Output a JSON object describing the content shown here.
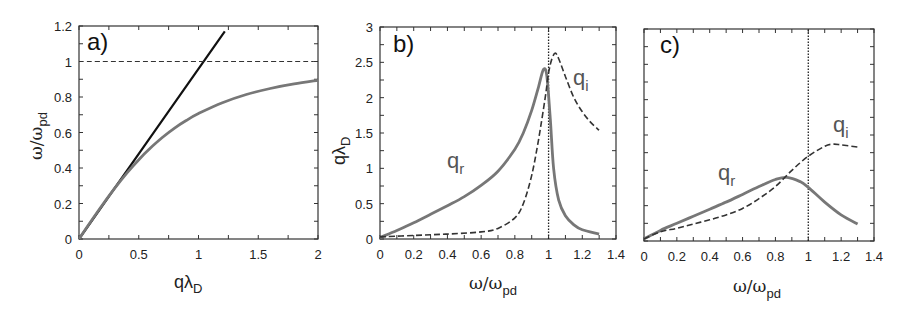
{
  "figure": {
    "panels": [
      {
        "id": "a",
        "label": "a)"
      },
      {
        "id": "b",
        "label": "b)"
      },
      {
        "id": "c",
        "label": "c)"
      }
    ]
  },
  "chart_data": [
    {
      "panel": "a)",
      "type": "line",
      "xlabel": "qλ_D",
      "ylabel": "ω/ω_pd",
      "xlim": [
        0,
        2
      ],
      "ylim": [
        0,
        1.2
      ],
      "xticks": [
        "0",
        "0.5",
        "1",
        "1.5",
        "2"
      ],
      "yticks": [
        "0",
        "0.2",
        "0.4",
        "0.6",
        "0.8",
        "1",
        "1.2"
      ],
      "grid": false,
      "series": [
        {
          "name": "linear (black solid)",
          "color": "#111111",
          "style": "solid",
          "x": [
            0,
            1.22
          ],
          "y": [
            0,
            1.17
          ]
        },
        {
          "name": "dispersion (gray solid)",
          "color": "#777777",
          "style": "solid",
          "x": [
            0,
            0.1,
            0.2,
            0.3,
            0.4,
            0.5,
            0.6,
            0.7,
            0.8,
            0.9,
            1.0,
            1.2,
            1.4,
            1.6,
            1.8,
            2.0
          ],
          "y": [
            0,
            0.1,
            0.196,
            0.287,
            0.371,
            0.447,
            0.514,
            0.573,
            0.625,
            0.669,
            0.707,
            0.768,
            0.814,
            0.848,
            0.874,
            0.894
          ]
        },
        {
          "name": "ω = ω_pd (dashed)",
          "color": "#333333",
          "style": "dashed",
          "x": [
            0,
            2
          ],
          "y": [
            1,
            1
          ]
        }
      ]
    },
    {
      "panel": "b)",
      "type": "line",
      "xlabel": "ω/ω_pd",
      "ylabel": "qλ_D",
      "xlim": [
        0,
        1.4
      ],
      "ylim": [
        0,
        3
      ],
      "xticks": [
        "0",
        "0.2",
        "0.4",
        "0.6",
        "0.8",
        "1",
        "1.2",
        "1.4"
      ],
      "yticks": [
        "0",
        "0.5",
        "1",
        "1.5",
        "2",
        "2.5",
        "3"
      ],
      "grid": false,
      "vline": {
        "x": 1,
        "style": "dotted"
      },
      "annotations": [
        "q_r",
        "q_i"
      ],
      "series": [
        {
          "name": "q_r",
          "color": "#777777",
          "style": "solid",
          "x": [
            0,
            0.1,
            0.2,
            0.3,
            0.4,
            0.5,
            0.6,
            0.7,
            0.8,
            0.85,
            0.9,
            0.94,
            0.97,
            0.99,
            1.01,
            1.03,
            1.06,
            1.1,
            1.15,
            1.2,
            1.3
          ],
          "y": [
            0.02,
            0.12,
            0.23,
            0.35,
            0.47,
            0.6,
            0.76,
            0.96,
            1.27,
            1.5,
            1.82,
            2.15,
            2.4,
            2.3,
            1.7,
            1.0,
            0.55,
            0.33,
            0.2,
            0.13,
            0.07
          ]
        },
        {
          "name": "q_i",
          "color": "#333333",
          "style": "dashed",
          "x": [
            0,
            0.2,
            0.4,
            0.6,
            0.7,
            0.8,
            0.85,
            0.9,
            0.94,
            0.98,
            1.0,
            1.02,
            1.04,
            1.06,
            1.1,
            1.15,
            1.2,
            1.25,
            1.3
          ],
          "y": [
            0.03,
            0.05,
            0.07,
            0.1,
            0.15,
            0.3,
            0.5,
            0.9,
            1.4,
            2.0,
            2.35,
            2.55,
            2.63,
            2.55,
            2.3,
            2.0,
            1.8,
            1.65,
            1.54
          ]
        }
      ]
    },
    {
      "panel": "c)",
      "type": "line",
      "xlabel": "ω/ω_pd",
      "ylabel": "",
      "xlim": [
        0,
        1.4
      ],
      "ylim": [
        0,
        3
      ],
      "xticks": [
        "0",
        "0.2",
        "0.4",
        "0.6",
        "0.8",
        "1",
        "1.2",
        "1.4"
      ],
      "yticks": [],
      "grid": false,
      "vline": {
        "x": 1,
        "style": "dotted"
      },
      "annotations": [
        "q_r",
        "q_i"
      ],
      "series": [
        {
          "name": "q_r",
          "color": "#777777",
          "style": "solid",
          "x": [
            0,
            0.1,
            0.2,
            0.3,
            0.4,
            0.5,
            0.6,
            0.7,
            0.8,
            0.87,
            0.95,
            1.0,
            1.1,
            1.2,
            1.3
          ],
          "y": [
            0.03,
            0.15,
            0.25,
            0.35,
            0.45,
            0.55,
            0.66,
            0.77,
            0.87,
            0.9,
            0.84,
            0.76,
            0.55,
            0.37,
            0.24
          ]
        },
        {
          "name": "q_i",
          "color": "#333333",
          "style": "dashed",
          "x": [
            0,
            0.1,
            0.2,
            0.3,
            0.4,
            0.5,
            0.6,
            0.7,
            0.8,
            0.9,
            1.0,
            1.1,
            1.15,
            1.2,
            1.3
          ],
          "y": [
            0.03,
            0.13,
            0.18,
            0.24,
            0.3,
            0.37,
            0.46,
            0.6,
            0.77,
            1.0,
            1.2,
            1.34,
            1.37,
            1.36,
            1.33
          ]
        }
      ]
    }
  ],
  "labels": {
    "a_xlabel_main": "qλ",
    "a_xlabel_sub": "D",
    "a_ylabel_main": "ω/ω",
    "a_ylabel_sub": "pd",
    "b_ylabel_main": "qλ",
    "b_ylabel_sub": "D",
    "bc_xlabel_main": "ω/ω",
    "bc_xlabel_sub": "pd",
    "qr_main": "q",
    "qr_sub": "r",
    "qi_main": "q",
    "qi_sub": "i"
  }
}
